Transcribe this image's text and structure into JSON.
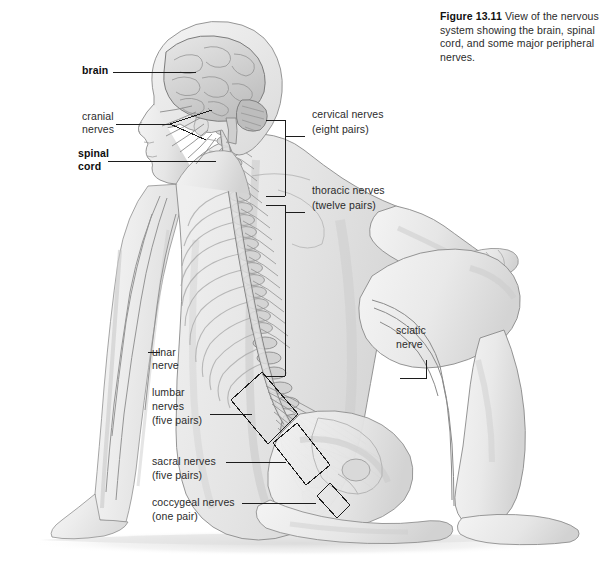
{
  "caption": {
    "figure_number": "Figure 13.11",
    "text": "View of the nervous system showing the brain, spinal cord, and some major peripheral nerves."
  },
  "labels": {
    "brain": "brain",
    "cranial_nerves_l1": "cranial",
    "cranial_nerves_l2": "nerves",
    "spinal_cord_l1": "spinal",
    "spinal_cord_l2": "cord",
    "cervical_l1": "cervical nerves",
    "cervical_l2": "(eight pairs)",
    "thoracic_l1": "thoracic nerves",
    "thoracic_l2": "(twelve pairs)",
    "ulnar_l1": "ulnar",
    "ulnar_l2": "nerve",
    "lumbar_l1": "lumbar",
    "lumbar_l2": "nerves",
    "lumbar_l3": "(five pairs)",
    "sacral_l1": "sacral nerves",
    "sacral_l2": "(five pairs)",
    "coccygeal_l1": "coccygeal nerves",
    "coccygeal_l2": "(one pair)",
    "sciatic_l1": "sciatic",
    "sciatic_l2": "nerve"
  },
  "colors": {
    "background": "#ffffff",
    "text": "#2b2b2b",
    "text_bold": "#0d0d0d",
    "leader_line": "#1c1c1c",
    "skin_light": "#f2f2f2",
    "skin_mid": "#e2e2e2",
    "skin_shadow": "#cfcfcf",
    "bone": "#d8d8d8",
    "nerve": "#9a9a9a",
    "outline": "#6e6e6e"
  },
  "illustration": {
    "type": "anatomical-diagram",
    "subject": "seated human figure, posterior view",
    "structures": [
      "brain",
      "cranial nerves",
      "spinal cord",
      "vertebral column",
      "rib cage",
      "cervical nerves",
      "thoracic nerves",
      "lumbar nerves",
      "sacral nerves",
      "coccygeal nerves",
      "cauda equina",
      "ulnar nerve",
      "sciatic nerve",
      "pelvis"
    ]
  }
}
